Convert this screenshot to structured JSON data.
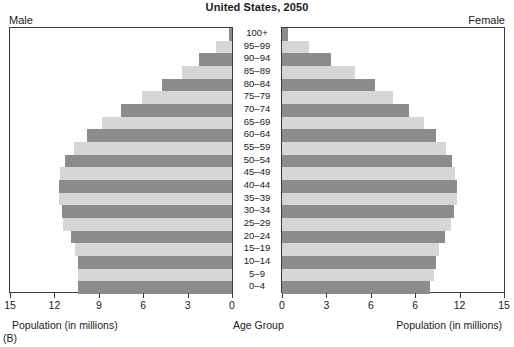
{
  "title": "United States, 2050",
  "labels": {
    "male": "Male",
    "female": "Female",
    "axis_left": "Population (in millions)",
    "axis_right": "Population (in millions)",
    "axis_center": "Age Group",
    "panel_tag": "(B)"
  },
  "colors": {
    "bar_dark": "#8c8c8c",
    "bar_light": "#d6d6d6",
    "frame": "#3a3a3a",
    "background": "#ffffff"
  },
  "axes": {
    "left_ticks": [
      "15",
      "12",
      "9",
      "6",
      "3",
      "0"
    ],
    "right_ticks": [
      "0",
      "3",
      "6",
      "6",
      "12",
      "15"
    ],
    "xmax": 15
  },
  "chart_data": {
    "type": "bar",
    "title": "United States, 2050",
    "subtitle": "",
    "xlabel": "Population (in millions)",
    "ylabel": "Age Group",
    "orientation": "horizontal",
    "layout": "population-pyramid",
    "grid": false,
    "legend": [
      {
        "name": "Male",
        "position": "top-left"
      },
      {
        "name": "Female",
        "position": "top-right"
      }
    ],
    "xlim": [
      0,
      15
    ],
    "left_tick_labels": [
      "15",
      "12",
      "9",
      "6",
      "3",
      "0"
    ],
    "right_tick_labels": [
      "0",
      "3",
      "6",
      "6",
      "12",
      "15"
    ],
    "categories": [
      "100+",
      "95–99",
      "90–94",
      "85–89",
      "80–84",
      "75–79",
      "70–74",
      "65–69",
      "60–64",
      "55–59",
      "50–54",
      "45–49",
      "40–44",
      "35–39",
      "30–34",
      "25–29",
      "20–24",
      "15–19",
      "10–14",
      "5–9",
      "0–4"
    ],
    "series": [
      {
        "name": "Male",
        "side": "left",
        "shade": [
          "dark",
          "light",
          "dark",
          "light",
          "dark",
          "light",
          "dark",
          "light",
          "dark",
          "light",
          "dark",
          "light",
          "dark",
          "light",
          "dark",
          "light",
          "dark",
          "light",
          "dark",
          "light",
          "dark"
        ],
        "values": [
          0.2,
          1.1,
          2.2,
          3.4,
          4.7,
          6.1,
          7.5,
          8.8,
          9.8,
          10.7,
          11.3,
          11.6,
          11.7,
          11.7,
          11.5,
          11.4,
          10.9,
          10.6,
          10.4,
          10.4,
          10.4
        ]
      },
      {
        "name": "Female",
        "side": "right",
        "shade": [
          "dark",
          "light",
          "dark",
          "light",
          "dark",
          "light",
          "dark",
          "light",
          "dark",
          "light",
          "dark",
          "light",
          "dark",
          "light",
          "dark",
          "light",
          "dark",
          "light",
          "dark",
          "light",
          "dark"
        ],
        "values": [
          0.4,
          1.8,
          3.3,
          4.9,
          6.3,
          7.5,
          8.6,
          9.6,
          10.4,
          11.1,
          11.5,
          11.7,
          11.8,
          11.8,
          11.6,
          11.4,
          11.0,
          10.6,
          10.4,
          10.3,
          10.0
        ]
      }
    ]
  }
}
